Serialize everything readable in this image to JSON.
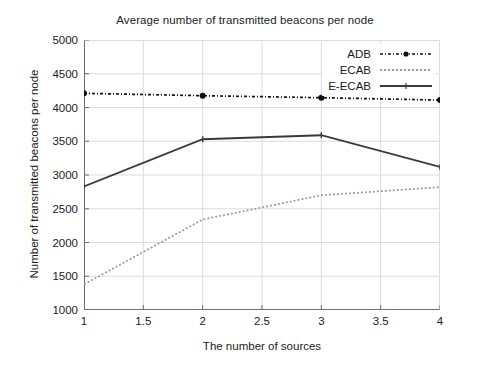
{
  "chart_data": {
    "type": "line",
    "title": "Average number of transmitted beacons per node",
    "xlabel": "The number of sources",
    "ylabel": "Number of transmitted beacons per node",
    "x": [
      1,
      2,
      3,
      4
    ],
    "xlim": [
      1,
      4
    ],
    "ylim": [
      1000,
      5000
    ],
    "xticks": [
      1,
      1.5,
      2,
      2.5,
      3,
      3.5,
      4
    ],
    "xtick_labels": [
      "1",
      "1.5",
      "2",
      "2.5",
      "3",
      "3.5",
      "4"
    ],
    "yticks": [
      1000,
      1500,
      2000,
      2500,
      3000,
      3500,
      4000,
      4500,
      5000
    ],
    "ytick_labels": [
      "1000",
      "1500",
      "2000",
      "2500",
      "3000",
      "3500",
      "4000",
      "4500",
      "5000"
    ],
    "grid": true,
    "legend_position": "top-right",
    "series": [
      {
        "name": "ADB",
        "values": [
          4210,
          4175,
          4145,
          4110
        ],
        "style": "dash-dot",
        "color": "#111111",
        "marker": "filled-circle"
      },
      {
        "name": "ECAB",
        "values": [
          1380,
          2340,
          2700,
          2820
        ],
        "style": "dotted",
        "color": "#9a9a9a",
        "marker": "none"
      },
      {
        "name": "E-ECAB",
        "values": [
          2830,
          3530,
          3590,
          3120
        ],
        "style": "solid",
        "color": "#3a3a3a",
        "marker": "small-tick"
      }
    ]
  },
  "colors": {
    "background": "#ffffff",
    "axis": "#6e6e6e",
    "grid": "#dcdcdc",
    "text": "#1a1a1a"
  }
}
